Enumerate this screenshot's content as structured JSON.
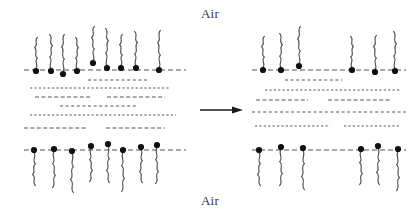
{
  "figure": {
    "title_top": "Air",
    "title_bottom": "Air",
    "caption": "",
    "type": "surfactant-film-schematic",
    "colors": {
      "ink": "#1a1a1a",
      "head": "#111111",
      "tail": "#4a4a4a",
      "dash": "#555555",
      "background": "#ffffff",
      "text": "#3a3a3a"
    }
  },
  "arrow": {
    "name": "transition-arrow",
    "x1": 200,
    "y1": 110,
    "x2": 243,
    "y2": 110,
    "direction": "right"
  },
  "panels": [
    {
      "id": "left-panel",
      "label": "dense-film",
      "interface_top_y": 70,
      "interface_bottom_y": 150,
      "interface_x1": 24,
      "interface_x2": 186,
      "top_monolayer": {
        "name": "top-monolayer-left",
        "count": 9,
        "heads": [
          {
            "x": 36,
            "y": 71
          },
          {
            "x": 51,
            "y": 71
          },
          {
            "x": 63,
            "y": 74
          },
          {
            "x": 77,
            "y": 71
          },
          {
            "x": 93,
            "y": 63
          },
          {
            "x": 107,
            "y": 68
          },
          {
            "x": 121,
            "y": 68
          },
          {
            "x": 136,
            "y": 68
          },
          {
            "x": 159,
            "y": 70
          }
        ]
      },
      "bottom_monolayer": {
        "name": "bottom-monolayer-left",
        "count": 8,
        "heads": [
          {
            "x": 34,
            "y": 150
          },
          {
            "x": 54,
            "y": 149
          },
          {
            "x": 72,
            "y": 151
          },
          {
            "x": 91,
            "y": 146
          },
          {
            "x": 108,
            "y": 144
          },
          {
            "x": 123,
            "y": 150
          },
          {
            "x": 141,
            "y": 147
          },
          {
            "x": 157,
            "y": 145
          }
        ]
      },
      "water_lines": [
        {
          "y": 80,
          "x1": 88,
          "x2": 148
        },
        {
          "y": 88,
          "x1": 30,
          "x2": 170
        },
        {
          "y": 97,
          "x1": 35,
          "x2": 92,
          "x3": 107,
          "x4": 165
        },
        {
          "y": 106,
          "x1": 60,
          "x2": 136
        },
        {
          "y": 115,
          "x1": 30,
          "x2": 176
        },
        {
          "y": 128,
          "x1": 24,
          "x2": 86,
          "x3": 106,
          "x4": 165
        }
      ]
    },
    {
      "id": "right-panel",
      "label": "thinned-film",
      "interface_top_y": 70,
      "interface_bottom_y": 150,
      "interface_x1": 252,
      "interface_x2": 406,
      "top_monolayer": {
        "name": "top-monolayer-right",
        "count": 6,
        "heads": [
          {
            "x": 263,
            "y": 70
          },
          {
            "x": 281,
            "y": 70
          },
          {
            "x": 299,
            "y": 66
          },
          {
            "x": 352,
            "y": 70
          },
          {
            "x": 375,
            "y": 72
          },
          {
            "x": 395,
            "y": 71
          }
        ]
      },
      "bottom_monolayer": {
        "name": "bottom-monolayer-right",
        "count": 6,
        "heads": [
          {
            "x": 259,
            "y": 150
          },
          {
            "x": 281,
            "y": 147
          },
          {
            "x": 303,
            "y": 148
          },
          {
            "x": 361,
            "y": 149
          },
          {
            "x": 378,
            "y": 146
          },
          {
            "x": 398,
            "y": 149
          }
        ]
      },
      "water_lines": [
        {
          "y": 80,
          "x1": 285,
          "x2": 342
        },
        {
          "y": 90,
          "x1": 265,
          "x2": 400
        },
        {
          "y": 100,
          "x1": 256,
          "x2": 308,
          "x3": 328,
          "x4": 390
        },
        {
          "y": 112,
          "x1": 252,
          "x2": 406
        },
        {
          "y": 126,
          "x1": 255,
          "x2": 330,
          "x3": 344,
          "x4": 400
        }
      ]
    }
  ]
}
